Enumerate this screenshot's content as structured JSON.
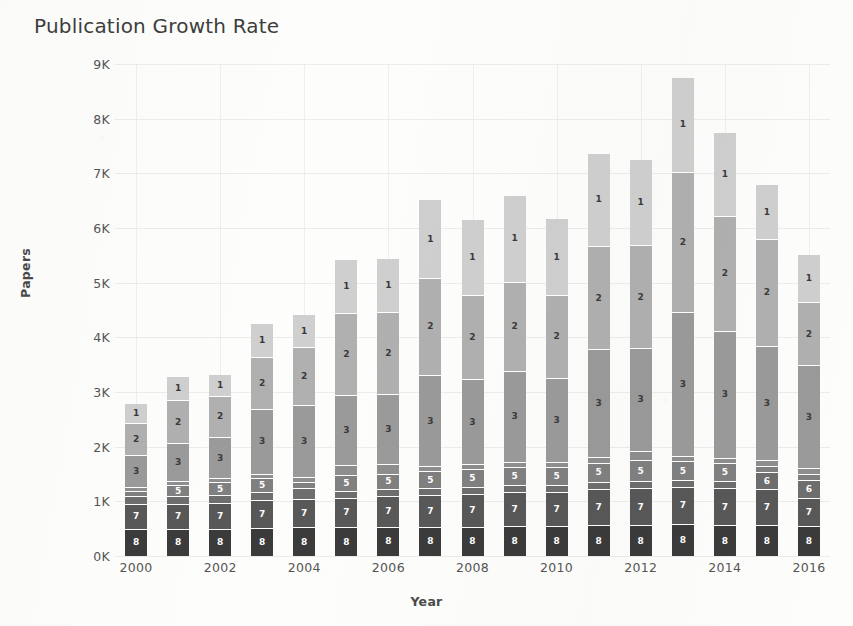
{
  "chart": {
    "title": "Publication Growth Rate",
    "xlabel": "Year",
    "ylabel": "Papers"
  },
  "chart_data": {
    "type": "bar",
    "stacked": true,
    "title": "Publication Growth Rate",
    "xlabel": "Year",
    "ylabel": "Papers",
    "ylim": [
      0,
      9000
    ],
    "ytick_labels": [
      "0K",
      "1K",
      "2K",
      "3K",
      "4K",
      "5K",
      "6K",
      "7K",
      "8K",
      "9K"
    ],
    "ytick_values": [
      0,
      1000,
      2000,
      3000,
      4000,
      5000,
      6000,
      7000,
      8000,
      9000
    ],
    "grid": true,
    "legend": "none",
    "xtick_labels": [
      "2000",
      "2002",
      "2004",
      "2006",
      "2008",
      "2010",
      "2012",
      "2014",
      "2016"
    ],
    "categories": [
      2000,
      2001,
      2002,
      2003,
      2004,
      2005,
      2006,
      2007,
      2008,
      2009,
      2010,
      2011,
      2012,
      2013,
      2014,
      2015,
      2016
    ],
    "series": [
      {
        "name": "8",
        "color": "#3b3b3b",
        "label": "8",
        "label_color": "#ffffff",
        "values": [
          480,
          480,
          480,
          500,
          510,
          510,
          520,
          520,
          520,
          530,
          530,
          540,
          540,
          560,
          540,
          540,
          530
        ]
      },
      {
        "name": "7",
        "color": "#585858",
        "label": "7",
        "label_color": "#ffffff",
        "values": [
          450,
          460,
          470,
          500,
          520,
          540,
          560,
          580,
          600,
          620,
          620,
          660,
          680,
          690,
          680,
          660,
          520
        ]
      },
      {
        "name": "6",
        "color": "#6e6e6e",
        "label": "6",
        "label_color": "#ffffff",
        "values": [
          140,
          130,
          140,
          160,
          190,
          120,
          120,
          130,
          130,
          130,
          130,
          140,
          140,
          130,
          130,
          320,
          330
        ]
      },
      {
        "name": "5",
        "color": "#808080",
        "label": "5",
        "label_color": "#ffffff",
        "values": [
          95,
          210,
          240,
          250,
          120,
          290,
          290,
          300,
          320,
          330,
          330,
          350,
          370,
          330,
          330,
          110,
          110
        ]
      },
      {
        "name": "4",
        "color": "#8e8e8e",
        "label": "4",
        "label_color": "#ffffff",
        "values": [
          80,
          70,
          70,
          80,
          90,
          180,
          180,
          90,
          90,
          90,
          90,
          100,
          180,
          100,
          100,
          100,
          100
        ]
      },
      {
        "name": "3",
        "color": "#9a9a9a",
        "label": "3",
        "label_color": "#3a3a3a",
        "values": [
          580,
          690,
          760,
          1180,
          1310,
          1290,
          1270,
          1680,
          1560,
          1670,
          1540,
          1970,
          1870,
          2640,
          2320,
          2100,
          1880
        ]
      },
      {
        "name": "2",
        "color": "#b0b0b0",
        "label": "2",
        "label_color": "#3a3a3a",
        "values": [
          590,
          790,
          750,
          950,
          1070,
          1490,
          1510,
          1760,
          1530,
          1630,
          1520,
          1900,
          1890,
          2560,
          2110,
          1950,
          1160
        ]
      },
      {
        "name": "1",
        "color": "#cfcfcf",
        "label": "1",
        "label_color": "#3a3a3a",
        "values": [
          360,
          440,
          400,
          630,
          590,
          1000,
          980,
          1450,
          1400,
          1580,
          1400,
          1700,
          1580,
          1740,
          1530,
          1000,
          880
        ]
      }
    ],
    "totals": [
      2775,
      3270,
      3310,
      4250,
      4400,
      5420,
      5430,
      6510,
      6150,
      6580,
      6160,
      7360,
      7250,
      8750,
      7740,
      6780,
      5510
    ]
  }
}
